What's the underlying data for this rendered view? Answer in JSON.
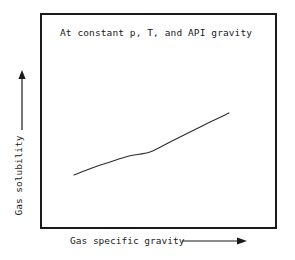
{
  "chart_data": {
    "type": "line",
    "title": "At constant p, T, and API gravity",
    "xlabel": "Gas specific gravity",
    "ylabel": "Gas solubility",
    "grid": false,
    "legend": null,
    "axis_ticks": {
      "x": [],
      "y": []
    },
    "xlim": [
      0,
      1
    ],
    "ylim": [
      0,
      1
    ],
    "annotations": [
      {
        "text": "At constant p, T, and API gravity",
        "position": "top-left-inside-frame"
      }
    ],
    "series": [
      {
        "name": "gas solubility vs gas specific gravity",
        "style": "solid-thin-black-curve",
        "x": [
          0.143,
          0.22,
          0.3,
          0.38,
          0.46,
          0.55,
          0.64,
          0.72,
          0.8,
          0.797
        ],
        "y": [
          0.25,
          0.285,
          0.325,
          0.372,
          0.425,
          0.487,
          0.552,
          0.617,
          0.685,
          0.685
        ],
        "points_px": [
          {
            "x": 74,
            "y": 175
          },
          {
            "x": 92,
            "y": 168
          },
          {
            "x": 110,
            "y": 162
          },
          {
            "x": 129,
            "y": 156
          },
          {
            "x": 150,
            "y": 152
          },
          {
            "x": 170,
            "y": 142
          },
          {
            "x": 190,
            "y": 132
          },
          {
            "x": 210,
            "y": 122
          },
          {
            "x": 229,
            "y": 113
          }
        ]
      }
    ]
  },
  "colors": {
    "frame": "#1a1a1a",
    "curve": "#2b2b2b",
    "text": "#1a1a1a",
    "background": "#ffffff"
  },
  "axes": {
    "y_arrow_direction": "up",
    "x_arrow_direction": "right"
  },
  "icons": {
    "y_arrow": "arrow-up-icon",
    "x_arrow": "arrow-right-icon"
  }
}
